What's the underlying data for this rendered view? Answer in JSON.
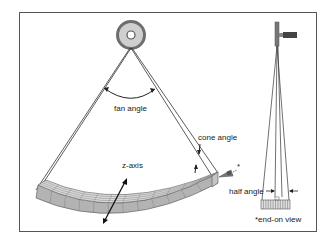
{
  "figure": {
    "labels": {
      "fan_angle": "fan angle",
      "cone_angle": "cone angle",
      "z_axis": "z-axis",
      "half_angle": "half angle",
      "end_on_view": "*end-on view",
      "view_marker": "*"
    },
    "components": {
      "source": "x-ray-tube-source",
      "detector": "curved-detector-array",
      "side_source": "x-ray-tube-side-view",
      "side_detector": "detector-end-on-view"
    },
    "colors": {
      "frame": "#555555",
      "line": "#333333",
      "detector_fill": "#b8b8b8",
      "detector_top": "#d8d8d8",
      "source_ring": "#777777",
      "source_inner": "#cfcfcf"
    }
  }
}
